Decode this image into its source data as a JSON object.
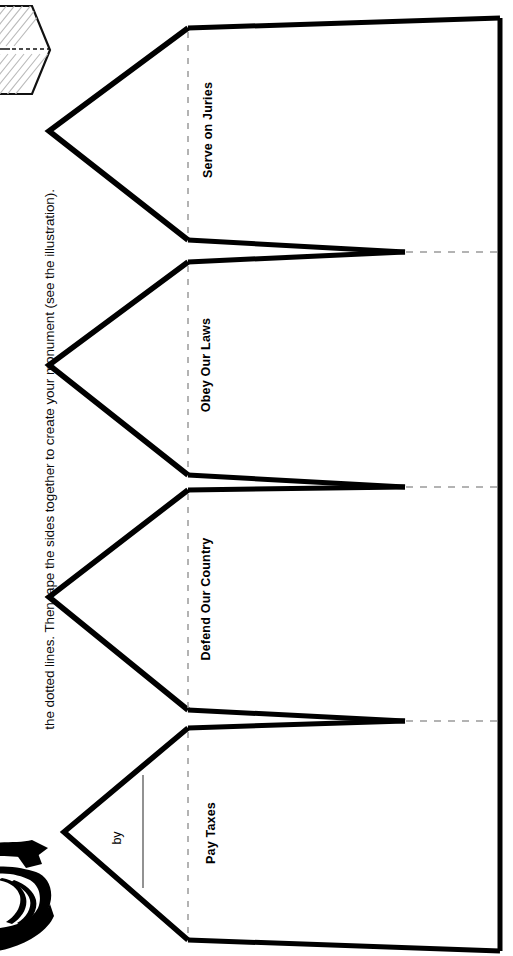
{
  "document": {
    "instruction_text": "the dotted lines. Then tape the sides together to create your monument (see the illustration).",
    "signature_prefix": "by"
  },
  "panels": [
    {
      "id": "serve-on-juries",
      "label": "Serve on Juries"
    },
    {
      "id": "obey-our-laws",
      "label": "Obey Our Laws"
    },
    {
      "id": "defend-our-country",
      "label": "Defend Our Country"
    },
    {
      "id": "pay-taxes",
      "label": "Pay Taxes"
    }
  ],
  "illustrations": [
    {
      "id": "folded-monument-illustration",
      "name": "folded-paper-monument-icon"
    },
    {
      "id": "hand-drawing-illustration",
      "name": "hand-with-pages-icon"
    }
  ],
  "colors": {
    "ink": "#000000",
    "paper": "#ffffff",
    "fold_line": "#9a9a9a"
  }
}
